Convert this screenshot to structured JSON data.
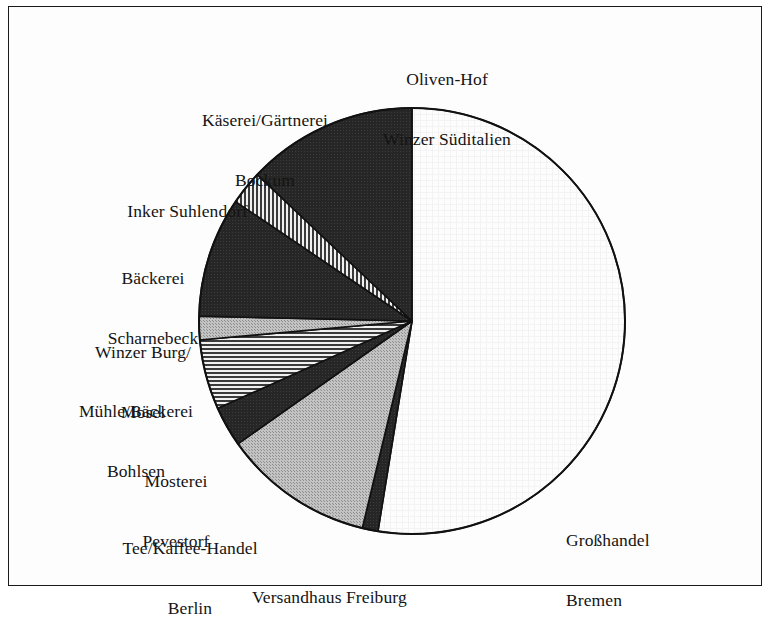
{
  "figure": {
    "border_color": "#1a1a1a",
    "background": "#fdfdfd"
  },
  "chart_data": {
    "type": "pie",
    "title": "",
    "subtitle": "",
    "xlabel": "",
    "ylabel": "",
    "legend_position": "outside-labels",
    "grid": false,
    "start_angle_deg": 0,
    "direction": "clockwise",
    "center": {
      "x": 412,
      "y": 321,
      "r": 213
    },
    "categories": [
      "Großhandel Bremen",
      "Versandhaus Freiburg",
      "Tee/Kaffee-Handel Berlin",
      "Mosterei Pevestorf",
      "Mühle/Bäckerei Bohlsen",
      "Winzer Burg/Mosel",
      "Bäckerei Scharnebeck",
      "Inker Suhlendorf",
      "Käserei/Gärtnerei Bockum",
      "Oliven-Hof Winzer Süditalien"
    ],
    "values": [
      52.6,
      1.2,
      11.5,
      3.1,
      5.3,
      1.8,
      9.1,
      2.6,
      12.9,
      0.0
    ],
    "angles_deg": [
      189.2,
      4.3,
      41.3,
      11.0,
      19.0,
      6.4,
      32.8,
      9.3,
      46.6,
      0.0
    ],
    "slices": [
      {
        "label": "Großhandel Bremen",
        "start_deg": 0.0,
        "end_deg": 189.2,
        "sweep_deg": 189.2,
        "percent": 52.6,
        "fill": "#fcfcfc",
        "pattern": "plain-light",
        "stroke": "#111111"
      },
      {
        "label": "Versandhaus Freiburg",
        "start_deg": 189.2,
        "end_deg": 193.5,
        "sweep_deg": 4.3,
        "percent": 1.2,
        "fill": "#272727",
        "pattern": "solid-dark",
        "stroke": "#111111"
      },
      {
        "label": "Tee/Kaffee-Handel Berlin",
        "start_deg": 193.5,
        "end_deg": 234.8,
        "sweep_deg": 41.3,
        "percent": 11.5,
        "fill": "#b5b5b5",
        "pattern": "solid-gray",
        "stroke": "#111111"
      },
      {
        "label": "Mosterei Pevestorf",
        "start_deg": 234.8,
        "end_deg": 245.8,
        "sweep_deg": 11.0,
        "percent": 3.1,
        "fill": "#272727",
        "pattern": "solid-dark",
        "stroke": "#111111"
      },
      {
        "label": "Mühle/Bäckerei Bohlsen",
        "start_deg": 245.8,
        "end_deg": 264.9,
        "sweep_deg": 19.1,
        "percent": 5.3,
        "fill": "#d8d8d8",
        "pattern": "horizontal-hatch",
        "stroke": "#111111"
      },
      {
        "label": "Winzer Burg/Mosel",
        "start_deg": 264.9,
        "end_deg": 271.3,
        "sweep_deg": 6.4,
        "percent": 1.8,
        "fill": "#b5b5b5",
        "pattern": "solid-gray",
        "stroke": "#111111"
      },
      {
        "label": "Bäckerei Scharnebeck",
        "start_deg": 271.3,
        "end_deg": 304.1,
        "sweep_deg": 32.8,
        "percent": 9.1,
        "fill": "#272727",
        "pattern": "solid-dark",
        "stroke": "#111111"
      },
      {
        "label": "Inker Suhlendorf",
        "start_deg": 304.1,
        "end_deg": 313.4,
        "sweep_deg": 9.3,
        "percent": 2.6,
        "fill": "#d8d8d8",
        "pattern": "vertical-hatch",
        "stroke": "#111111"
      },
      {
        "label": "Käserei/Gärtnerei Bockum",
        "start_deg": 313.4,
        "end_deg": 360.0,
        "sweep_deg": 46.6,
        "percent": 12.9,
        "fill": "#272727",
        "pattern": "solid-dark",
        "stroke": "#111111"
      }
    ],
    "labels": [
      {
        "id": "oliven-hof",
        "line1": "Oliven-Hof",
        "line2": "Winzer Süditalien"
      },
      {
        "id": "kaeserei",
        "line1": "Käserei/Gärtnerei",
        "line2": "Bockum"
      },
      {
        "id": "inker",
        "line1": "Inker Suhlendorf",
        "line2": ""
      },
      {
        "id": "baeckerei-scharnebeck",
        "line1": "Bäckerei",
        "line2": "Scharnebeck"
      },
      {
        "id": "winzer-burg",
        "line1": "Winzer Burg/",
        "line2": "Mosel"
      },
      {
        "id": "muehle-bohlsen",
        "line1": "Mühle/Bäckerei",
        "line2": "Bohlsen"
      },
      {
        "id": "mosterei",
        "line1": "Mosterei",
        "line2": "Pevestorf"
      },
      {
        "id": "tee-kaffee",
        "line1": "Tee/Kaffee-Handel",
        "line2": "Berlin"
      },
      {
        "id": "versandhaus",
        "line1": "Versandhaus Freiburg",
        "line2": ""
      },
      {
        "id": "grosshandel",
        "line1": "Großhandel",
        "line2": "Bremen"
      }
    ]
  }
}
